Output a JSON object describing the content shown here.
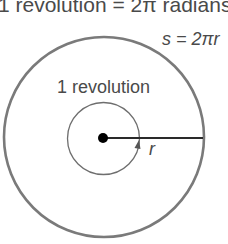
{
  "diagram": {
    "title": "1 revolution = 2π radians",
    "arc_label": "s = 2πr",
    "inner_label": "1 revolution",
    "radius_label": "r",
    "colors": {
      "outer_circle": "#7a7a7a",
      "inner_circle": "#6e6e6e",
      "radius_line": "#2a2a2a",
      "center_dot": "#000000",
      "text": "#4a4a4a"
    }
  }
}
